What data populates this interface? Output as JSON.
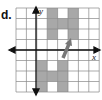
{
  "figure": {
    "part_label": "d.",
    "x_axis_label": "x",
    "y_axis_label": "y",
    "grid": {
      "cols": 8,
      "rows": 8,
      "origin_col": 2,
      "origin_row": 4
    },
    "shapes": [
      {
        "name": "H-figure-original",
        "color": "#a8a8a8",
        "cells": [
          [
            3,
            0
          ],
          [
            3,
            1
          ],
          [
            3,
            2
          ],
          [
            4,
            1
          ],
          [
            5,
            0
          ],
          [
            5,
            1
          ],
          [
            5,
            2
          ]
        ]
      },
      {
        "name": "H-figure-image",
        "color": "#a8a8a8",
        "cells": [
          [
            2,
            5
          ],
          [
            2,
            6
          ],
          [
            2,
            7
          ],
          [
            3,
            6
          ],
          [
            4,
            5
          ],
          [
            4,
            6
          ],
          [
            4,
            7
          ]
        ]
      }
    ],
    "arrow_color": "#777777"
  }
}
